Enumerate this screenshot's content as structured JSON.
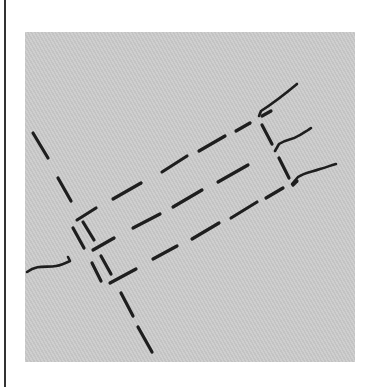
{
  "diagram": {
    "type": "sketch-map",
    "colors": {
      "background": "#ffffff",
      "ground_light": "#cfcfcf",
      "ground_dark": "#c3c3c3",
      "ink": "#1e1e1e",
      "frame": "#333333"
    },
    "ground": {
      "x": 25,
      "y": 32,
      "width": 330,
      "height": 330
    },
    "dashed_line_main": [
      [
        33,
        133,
        48,
        158
      ],
      [
        58,
        178,
        71,
        201
      ],
      [
        121,
        293,
        133,
        316
      ],
      [
        138,
        327,
        152,
        352
      ]
    ],
    "outer_rect_top_edge": [
      [
        77,
        220,
        96,
        208
      ],
      [
        113,
        199,
        141,
        183
      ],
      [
        162,
        172,
        187,
        156
      ],
      [
        199,
        151,
        225,
        136
      ],
      [
        236,
        131,
        250,
        123
      ]
    ],
    "middle_edge": [
      [
        93,
        250,
        114,
        238
      ],
      [
        133,
        228,
        160,
        214
      ],
      [
        173,
        207,
        202,
        190
      ],
      [
        218,
        182,
        248,
        165
      ]
    ],
    "bottom_edge": [
      [
        110,
        283,
        136,
        269
      ],
      [
        153,
        259,
        177,
        246
      ],
      [
        192,
        239,
        219,
        223
      ],
      [
        231,
        218,
        257,
        202
      ],
      [
        266,
        198,
        283,
        188
      ]
    ],
    "left_end_verticals": [
      [
        73,
        228,
        84,
        248
      ],
      [
        83,
        222,
        94,
        240
      ],
      [
        92,
        263,
        101,
        281
      ],
      [
        101,
        256,
        111,
        274
      ]
    ],
    "right_end_verticals": [
      [
        262,
        125,
        272,
        144
      ],
      [
        279,
        158,
        289,
        178
      ]
    ],
    "curves": [
      {
        "name": "left-road",
        "path": "M27,272 C38,264 47,268 56,266 C62,265 66,263 70,261 L68,257"
      },
      {
        "name": "top-right-road",
        "path": "M259,116 L261,111 C272,104 285,94 297,84"
      },
      {
        "name": "middle-right-road",
        "path": "M275,151 L279,144 C286,139 292,140 298,136 C303,133 307,131 311,128"
      },
      {
        "name": "bottom-right-road",
        "path": "M292,184 L298,177 C305,172 312,172 320,169 C327,167 332,165 336,164"
      }
    ],
    "extra_marks": [
      [
        262,
        116,
        271,
        111
      ],
      [
        293,
        185,
        297,
        181
      ]
    ]
  }
}
